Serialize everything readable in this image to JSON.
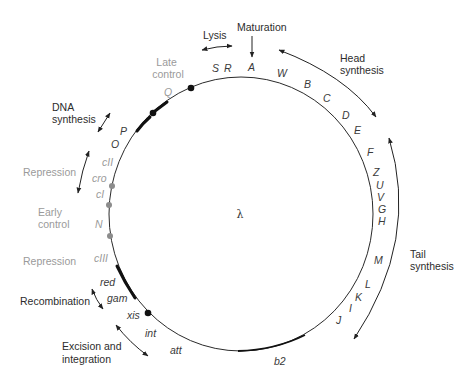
{
  "center_label": "λ",
  "colors": {
    "line": "#2a2a2a",
    "gray_text": "#9a9a9a",
    "gray_marker": "#8c8c8c",
    "black_marker": "#111111"
  },
  "genes": {
    "S": "S",
    "R": "R",
    "A": "A",
    "W": "W",
    "B": "B",
    "C": "C",
    "D": "D",
    "E": "E",
    "F": "F",
    "Z": "Z",
    "U": "U",
    "V": "V",
    "G": "G",
    "H": "H",
    "M": "M",
    "L": "L",
    "K": "K",
    "I": "I",
    "J": "J",
    "b2": "b2",
    "att": "att",
    "int": "int",
    "xis": "xis",
    "gam": "gam",
    "red": "red",
    "cIII": "cIII",
    "N": "N",
    "cI": "cI",
    "cro": "cro",
    "cII": "cII",
    "O": "O",
    "P": "P",
    "Q": "Q"
  },
  "functions": {
    "lysis": "Lysis",
    "maturation": "Maturation",
    "head_synthesis": [
      "Head",
      "synthesis"
    ],
    "tail_synthesis": [
      "Tail",
      "synthesis"
    ],
    "late_control": [
      "Late",
      "control"
    ],
    "dna_synthesis": [
      "DNA",
      "synthesis"
    ],
    "repression_upper": "Repression",
    "early_control": [
      "Early",
      "control"
    ],
    "repression_lower": "Repression",
    "recombination": "Recombination",
    "excision_integration": [
      "Excision and",
      "integration"
    ]
  }
}
